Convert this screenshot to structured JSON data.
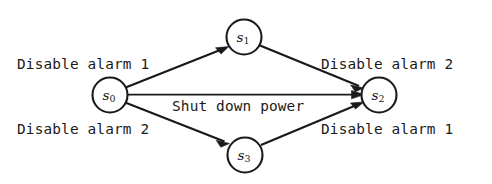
{
  "diagram": {
    "type": "state-transition-diagram",
    "background_color": "#ffffff",
    "stroke_color": "#1a1a1a",
    "nodes": [
      {
        "id": "s0",
        "symbol": "s",
        "subscript": "0",
        "cx": 110,
        "cy": 95,
        "r": 17.5
      },
      {
        "id": "s1",
        "symbol": "s",
        "subscript": "1",
        "cx": 244,
        "cy": 37,
        "r": 17.5
      },
      {
        "id": "s2",
        "symbol": "s",
        "subscript": "2",
        "cx": 379,
        "cy": 95,
        "r": 17.5
      },
      {
        "id": "s3",
        "symbol": "s",
        "subscript": "3",
        "cx": 245,
        "cy": 155,
        "r": 17.5
      }
    ],
    "edges": [
      {
        "id": "e-s0-s1",
        "from": "s0",
        "to": "s1",
        "label": "Disable alarm 1"
      },
      {
        "id": "e-s1-s2",
        "from": "s1",
        "to": "s2",
        "label": "Disable alarm 2"
      },
      {
        "id": "e-s0-s2",
        "from": "s0",
        "to": "s2",
        "label": "Shut down power"
      },
      {
        "id": "e-s0-s3",
        "from": "s0",
        "to": "s3",
        "label": "Disable alarm 2"
      },
      {
        "id": "e-s3-s2",
        "from": "s3",
        "to": "s2",
        "label": "Disable alarm 1"
      }
    ],
    "labels": {
      "disable_alarm_1_top": "Disable alarm 1",
      "disable_alarm_2_top": "Disable alarm 2",
      "shut_down_power": "Shut down power",
      "disable_alarm_2_bottom": "Disable alarm 2",
      "disable_alarm_1_bottom": "Disable alarm 1"
    }
  }
}
